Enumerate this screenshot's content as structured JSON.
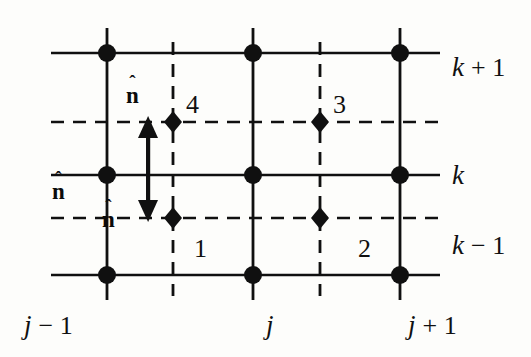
{
  "figure": {
    "type": "staggered-grid-diagram",
    "background_color": "#fdfdfb",
    "ink_color": "#101010",
    "width": 531,
    "height": 357
  },
  "axes": {
    "row_labels": [
      {
        "id": "k-plus-1",
        "base": "k",
        "op": " + 1",
        "x": 452,
        "y": 54
      },
      {
        "id": "k",
        "base": "k",
        "op": "",
        "x": 452,
        "y": 162
      },
      {
        "id": "k-minus-1",
        "base": "k",
        "op": " − 1",
        "x": 452,
        "y": 232
      }
    ],
    "column_labels": [
      {
        "id": "j-minus-1",
        "base": "j",
        "op": " − 1",
        "x": 24,
        "y": 312
      },
      {
        "id": "j",
        "base": "j",
        "op": "",
        "x": 266,
        "y": 312
      },
      {
        "id": "j-plus-1",
        "base": "j",
        "op": " + 1",
        "x": 408,
        "y": 312
      }
    ]
  },
  "grid": {
    "solid_vertical_x": [
      107,
      253,
      400
    ],
    "solid_horizontal_y": [
      53,
      175,
      275
    ],
    "dashed_vertical_x": [
      173,
      320
    ],
    "dashed_horizontal_y": [
      122,
      218
    ],
    "vertical_span": [
      28,
      300
    ],
    "horizontal_span": [
      51,
      440
    ],
    "dashed_vertical_span": [
      42,
      296
    ],
    "dashed_horizontal_span": [
      51,
      440
    ]
  },
  "nodes": [
    {
      "id": "node-jm1-kp1",
      "x": 107,
      "y": 53,
      "r": 9
    },
    {
      "id": "node-j-kp1",
      "x": 253,
      "y": 53,
      "r": 9
    },
    {
      "id": "node-jp1-kp1",
      "x": 400,
      "y": 53,
      "r": 9
    },
    {
      "id": "node-jm1-k",
      "x": 107,
      "y": 175,
      "r": 9
    },
    {
      "id": "node-j-k",
      "x": 253,
      "y": 175,
      "r": 9
    },
    {
      "id": "node-jp1-k",
      "x": 400,
      "y": 175,
      "r": 9
    },
    {
      "id": "node-jm1-km1",
      "x": 107,
      "y": 275,
      "r": 9
    },
    {
      "id": "node-j-km1",
      "x": 253,
      "y": 275,
      "r": 9
    },
    {
      "id": "node-jp1-km1",
      "x": 400,
      "y": 275,
      "r": 9
    }
  ],
  "face_points": [
    {
      "id": "face-point-4",
      "x": 173,
      "y": 122,
      "rx": 9,
      "ry": 11
    },
    {
      "id": "face-point-3",
      "x": 320,
      "y": 122,
      "rx": 9,
      "ry": 11
    },
    {
      "id": "face-point-1",
      "x": 173,
      "y": 218,
      "rx": 9,
      "ry": 11
    },
    {
      "id": "face-point-2",
      "x": 320,
      "y": 218,
      "rx": 9,
      "ry": 11
    }
  ],
  "cell_numbers": [
    {
      "id": "cell-number-4",
      "text": "4",
      "x": 186,
      "y": 92
    },
    {
      "id": "cell-number-3",
      "text": "3",
      "x": 333,
      "y": 92
    },
    {
      "id": "cell-number-1",
      "text": "1",
      "x": 194,
      "y": 236
    },
    {
      "id": "cell-number-2",
      "text": "2",
      "x": 358,
      "y": 236
    }
  ],
  "normals": [
    {
      "id": "normal-top",
      "accent": "ˆ",
      "symbol": "n",
      "x": 126,
      "y": 77
    },
    {
      "id": "normal-left",
      "accent": "ˆ",
      "symbol": "n",
      "x": 52,
      "y": 173
    },
    {
      "id": "normal-bottom",
      "accent": "ˆ",
      "symbol": "n",
      "x": 102,
      "y": 201
    }
  ],
  "arrow": {
    "id": "double-headed-normal-arrow",
    "x": 148,
    "y_top": 120,
    "y_bottom": 218,
    "head_size": 10,
    "shaft_width": 4,
    "direction": "double"
  }
}
